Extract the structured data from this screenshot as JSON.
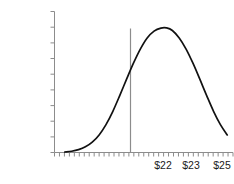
{
  "chart_data": {
    "type": "line",
    "title": "",
    "xlabel": "",
    "ylabel": "Density",
    "ylim": [
      0,
      0.9
    ],
    "grid": false,
    "legend": "none",
    "y_ticks": [
      "0.9",
      "0.8",
      "0.7",
      "0.6",
      "0.5",
      "0.4",
      "0.3",
      "0.2",
      "0.1",
      "0"
    ],
    "y_tick_values": [
      0.9,
      0.8,
      0.7,
      0.6,
      0.5,
      0.4,
      0.3,
      0.2,
      0.1,
      0
    ],
    "x_tick_labels": [
      "$22",
      "$23",
      "$25"
    ],
    "x_tick_label_values": [
      22,
      23,
      25
    ],
    "x_axis_minor_ticks": 36,
    "annotations": [
      {
        "name": "mode-line",
        "type": "vertical-line",
        "x": 23.45,
        "y_top": 0.795,
        "color": "#8c8c8c"
      }
    ],
    "series": [
      {
        "name": "density",
        "color": "#111111",
        "peak_value": 0.795,
        "x": [
          19.0,
          19.3,
          19.6,
          19.9,
          20.2,
          20.5,
          20.8,
          21.1,
          21.4,
          21.7,
          22.0,
          22.3,
          22.6,
          22.9,
          23.2,
          23.45,
          23.7,
          24.0,
          24.3,
          24.6,
          24.9,
          25.2,
          25.5,
          25.8,
          26.1
        ],
        "values": [
          0.003,
          0.008,
          0.018,
          0.036,
          0.066,
          0.112,
          0.178,
          0.263,
          0.363,
          0.468,
          0.57,
          0.66,
          0.731,
          0.775,
          0.794,
          0.795,
          0.779,
          0.731,
          0.66,
          0.57,
          0.468,
          0.363,
          0.263,
          0.178,
          0.112
        ]
      }
    ]
  },
  "axes": {
    "y_axis_color": "#8c8c8c",
    "x_axis_color": "#8c8c8c",
    "curve_color": "#111111",
    "mode_line_color": "#8c8c8c",
    "text_color": "#1a1a1a",
    "background": "#ffffff"
  },
  "labels": {
    "density": "Density",
    "y0": "0.9",
    "y1": "0.8",
    "y2": "0.7",
    "y3": "0.6",
    "y4": "0.5",
    "y5": "0.4",
    "y6": "0.3",
    "y7": "0.2",
    "y8": "0.1",
    "y9": "0",
    "x0": "$22",
    "x1": "$23",
    "x2": "$25"
  }
}
